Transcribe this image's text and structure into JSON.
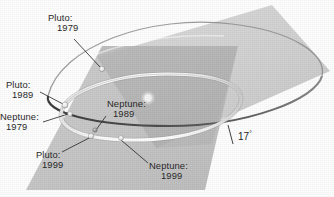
{
  "figure": {
    "background_color": "#ffffff",
    "inclination": {
      "label": "17",
      "degree_symbol": "°",
      "name": "orbital-inclination-angle"
    },
    "sun": {
      "name": "sun",
      "color": "#e9e9e9"
    },
    "planes": [
      {
        "name": "neptune-orbital-plane",
        "label": "Neptune orbital plane",
        "fill": "#c9c9c9",
        "opacity": 0.85
      },
      {
        "name": "pluto-orbital-plane",
        "label": "Pluto orbital plane inclined 17 degrees",
        "fill": "#bdbdbd",
        "opacity": 0.75
      }
    ],
    "orbits": [
      {
        "name": "pluto-orbit",
        "body": "Pluto",
        "stroke": "#4a4a4a",
        "style": "dark-ellipse"
      },
      {
        "name": "neptune-orbit",
        "body": "Neptune",
        "stroke": "#fbfbfb",
        "style": "bright-band"
      }
    ],
    "markers": [
      {
        "name": "marker-pluto-1979",
        "body": "Pluto",
        "year": "1979",
        "x": 102,
        "y": 69,
        "r": 2.6,
        "color": "#f2f2f2"
      },
      {
        "name": "marker-pluto-1989",
        "body": "Pluto",
        "year": "1989",
        "x": 65,
        "y": 105,
        "r": 2.9,
        "color": "#efefef"
      },
      {
        "name": "marker-neptune-1979",
        "body": "Neptune",
        "year": "1979",
        "x": 70,
        "y": 114,
        "r": 2.4,
        "color": "#d8d8d8"
      },
      {
        "name": "marker-pluto-1999",
        "body": "Pluto",
        "year": "1999",
        "x": 92,
        "y": 134,
        "r": 2.6,
        "color": "#f4f4f4"
      },
      {
        "name": "marker-neptune-1989",
        "body": "Neptune",
        "year": "1989",
        "x": 95,
        "y": 130,
        "r": 2.3,
        "color": "#9e9e9e"
      },
      {
        "name": "marker-neptune-1999",
        "body": "Neptune",
        "year": "1999",
        "x": 120,
        "y": 137,
        "r": 2.5,
        "color": "#f0f0f0"
      }
    ],
    "labels": [
      {
        "name": "label-pluto-1979",
        "body": "Pluto:",
        "year": "1979",
        "x": 48,
        "y": 18,
        "indent": "c-ind"
      },
      {
        "name": "label-pluto-1989",
        "body": "Pluto:",
        "year": "1989",
        "x": 7,
        "y": 85,
        "indent": "c-ind2"
      },
      {
        "name": "label-neptune-1979",
        "body": "Neptune:",
        "year": "1979",
        "x": 1,
        "y": 117,
        "indent": "c-ind2"
      },
      {
        "name": "label-neptune-1989",
        "body": "Neptune:",
        "year": "1989",
        "x": 108,
        "y": 104,
        "indent": "c-ind2"
      },
      {
        "name": "label-pluto-1999",
        "body": "Pluto:",
        "year": "1999",
        "x": 37,
        "y": 155,
        "indent": "c-ind2"
      },
      {
        "name": "label-neptune-1999",
        "body": "Neptune:",
        "year": "1999",
        "x": 150,
        "y": 166,
        "indent": "c-ind3"
      }
    ]
  }
}
